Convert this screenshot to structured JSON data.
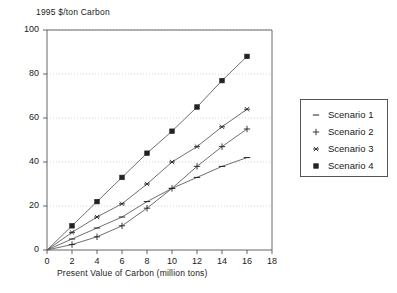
{
  "chart_data": {
    "type": "line",
    "title": "",
    "ylabel": "1995 $/ton Carbon",
    "xlabel": "Present Value of Carbon (million tons)",
    "xlim": [
      0,
      18
    ],
    "ylim": [
      0,
      100
    ],
    "xticks": [
      "0",
      "2",
      "4",
      "6",
      "8",
      "10",
      "12",
      "14",
      "16",
      "18"
    ],
    "yticks": [
      "0",
      "20",
      "40",
      "60",
      "80",
      "100"
    ],
    "grid": true,
    "grid_axis": "y",
    "legend_position": "right",
    "x": [
      0,
      2,
      4,
      6,
      8,
      10,
      12,
      14,
      16
    ],
    "series": [
      {
        "name": "Scenario 1",
        "marker": "dash",
        "values": [
          0,
          5,
          10,
          15,
          22,
          28,
          33,
          38,
          42
        ]
      },
      {
        "name": "Scenario 2",
        "marker": "plus",
        "values": [
          0,
          2.5,
          6,
          11,
          19,
          28,
          38,
          47,
          55
        ]
      },
      {
        "name": "Scenario 3",
        "marker": "asterisk",
        "values": [
          0,
          8,
          15,
          21,
          30,
          40,
          47,
          56,
          64
        ]
      },
      {
        "name": "Scenario 4",
        "marker": "filled-square",
        "values": [
          0,
          11,
          22,
          33,
          44,
          54,
          65,
          77,
          88
        ]
      }
    ],
    "colors": {
      "line": "#555555",
      "marker": "#222222",
      "axis": "#555555",
      "grid": "#cccccc",
      "text": "#1a1a1a",
      "background": "#ffffff"
    }
  },
  "legend": {
    "items": [
      {
        "label": "Scenario 1"
      },
      {
        "label": "Scenario 2"
      },
      {
        "label": "Scenario 3"
      },
      {
        "label": "Scenario 4"
      }
    ]
  }
}
